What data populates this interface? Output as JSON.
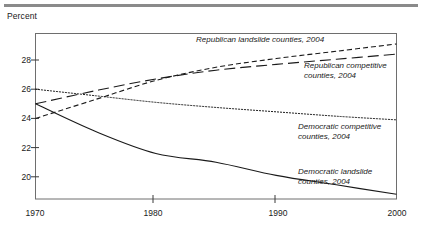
{
  "figure": {
    "axis_caption": "Percent",
    "rule_color": "#8a8a8a",
    "frame_color": "#6e6e6e",
    "ink_color": "#1a1a1a"
  },
  "chart_data": {
    "type": "line",
    "title": "",
    "subtitle": "",
    "xlabel": "",
    "ylabel": "Percent",
    "xlim": [
      1970,
      2000
    ],
    "ylim": [
      18.4,
      29.7
    ],
    "grid": false,
    "legend_position": "inline-annotations",
    "xticks": [
      1970,
      1980,
      1990,
      2000
    ],
    "xtick_labels": [
      "1970",
      "1980",
      "1990",
      "2000"
    ],
    "yticks": [
      20,
      22,
      24,
      26,
      28
    ],
    "ytick_labels": [
      "20",
      "22",
      "24",
      "26",
      "28"
    ],
    "x": [
      1970,
      1975,
      1980,
      1985,
      1990,
      1995,
      2000
    ],
    "series": [
      {
        "name": "Republican landslide counties, 2004",
        "style": "short-dash",
        "dasharray": "5,3",
        "values": [
          24.0,
          25.3,
          26.6,
          27.5,
          28.1,
          28.6,
          29.1
        ]
      },
      {
        "name": "Republican competitive counties, 2004",
        "style": "long-dash",
        "dasharray": "11,5",
        "values": [
          25.0,
          25.9,
          26.7,
          27.3,
          27.7,
          28.05,
          28.4
        ]
      },
      {
        "name": "Democratic competitive counties, 2004",
        "style": "dotted",
        "dasharray": "1.2,1.8",
        "values": [
          26.0,
          25.55,
          25.1,
          24.75,
          24.45,
          24.15,
          23.9
        ]
      },
      {
        "name": "Democratic landslide counties, 2004",
        "style": "solid",
        "dasharray": "none",
        "values": [
          25.0,
          23.1,
          21.6,
          21.0,
          20.1,
          19.45,
          18.8
        ]
      }
    ],
    "annotations": [
      {
        "text_line1": "Republican landslide counties, 2004",
        "text_line2": ""
      },
      {
        "text_line1": "Republican competitive",
        "text_line2": "counties, 2004"
      },
      {
        "text_line1": "Democratic competitive",
        "text_line2": "counties, 2004"
      },
      {
        "text_line1": "Democratic landslide",
        "text_line2": "counties, 2004"
      }
    ]
  }
}
